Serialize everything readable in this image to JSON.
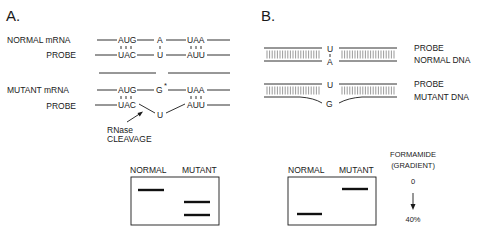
{
  "panel_a": {
    "title": "A.",
    "normal": {
      "mrna_label": "NORMAL mRNA",
      "probe_label": "PROBE",
      "mrna_codons": [
        "AUG",
        "A",
        "UAA"
      ],
      "probe_codons": [
        "UAC",
        "U",
        "AUU"
      ]
    },
    "mutant": {
      "mrna_label": "MUTANT mRNA",
      "probe_label": "PROBE",
      "mrna_codons": [
        "AUG",
        "G",
        "UAA"
      ],
      "mutation_marker": "*",
      "probe_codons": [
        "UAC",
        "U",
        "AUU"
      ]
    },
    "cleavage_label_1": "RNase",
    "cleavage_label_2": "CLEAVAGE",
    "gel": {
      "lane_labels": [
        "NORMAL",
        "MUTANT"
      ]
    }
  },
  "panel_b": {
    "title": "B.",
    "normal": {
      "top_base": "U",
      "bottom_base": "A",
      "label_1": "PROBE",
      "label_2": "NORMAL DNA"
    },
    "mutant": {
      "top_base": "U",
      "bottom_base": "G",
      "label_1": "PROBE",
      "label_2": "MUTANT DNA"
    },
    "gel": {
      "lane_labels": [
        "NORMAL",
        "MUTANT"
      ],
      "gradient_title_1": "FORMAMIDE",
      "gradient_title_2": "(GRADIENT)",
      "gradient_start": "0",
      "gradient_end": "40%"
    }
  }
}
